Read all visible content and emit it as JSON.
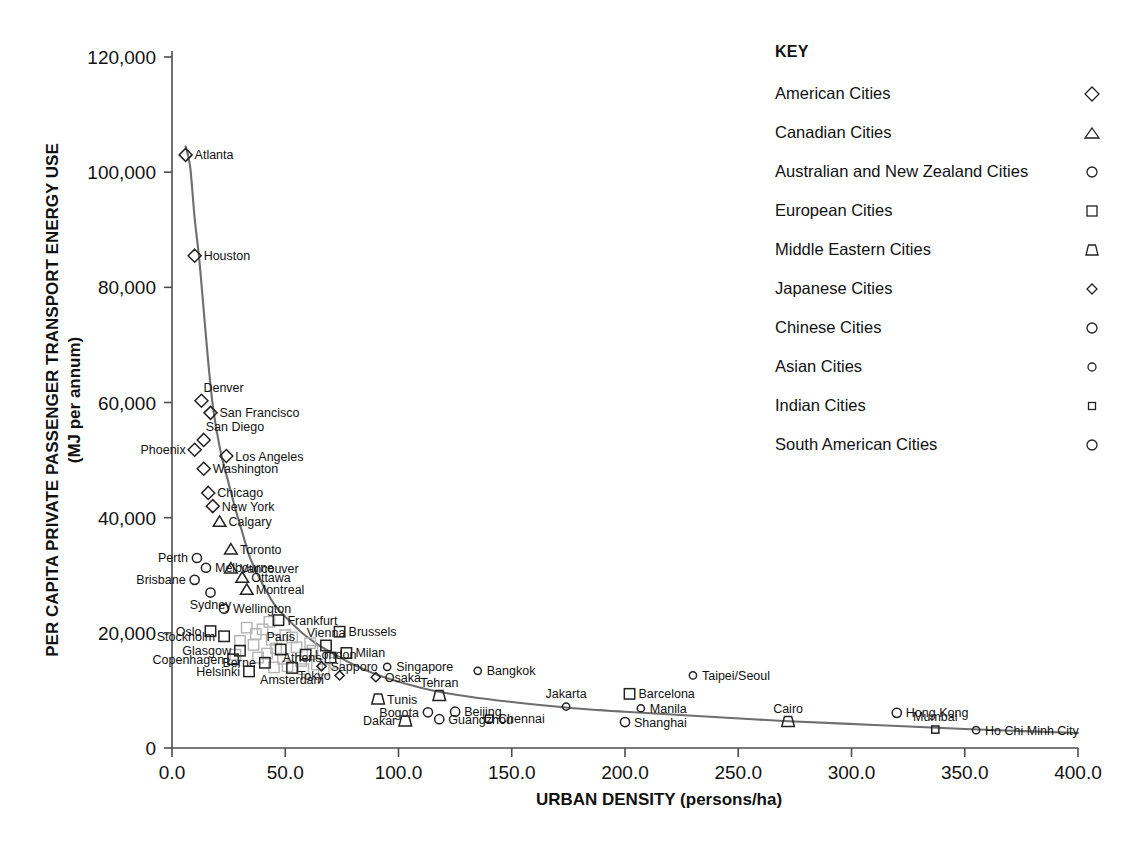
{
  "chart_data": {
    "type": "scatter",
    "title": "",
    "xlabel": "URBAN DENSITY (persons/ha)",
    "ylabel": "PER CAPITA PRIVATE PASSENGER TRANSPORT ENERGY USE",
    "ylabel_sub": "(MJ per annum)",
    "xlim": [
      0,
      400
    ],
    "ylim": [
      0,
      120000
    ],
    "xticks": [
      "0.0",
      "50.0",
      "100.0",
      "150.0",
      "200.0",
      "250.0",
      "300.0",
      "350.0",
      "400.0"
    ],
    "xtick_values": [
      0,
      50,
      100,
      150,
      200,
      250,
      300,
      350,
      400
    ],
    "yticks": [
      "0",
      "20,000",
      "40,000",
      "60,000",
      "80,000",
      "100,000",
      "120,000"
    ],
    "ytick_values": [
      0,
      20000,
      40000,
      60000,
      80000,
      100000,
      120000
    ],
    "grid": false,
    "legend_position": "right",
    "trend_curve": [
      [
        6,
        104500
      ],
      [
        8,
        101000
      ],
      [
        10,
        92000
      ],
      [
        12,
        85000
      ],
      [
        14,
        76000
      ],
      [
        16,
        67000
      ],
      [
        18,
        59500
      ],
      [
        20,
        54500
      ],
      [
        22,
        50500
      ],
      [
        25,
        46000
      ],
      [
        28,
        41500
      ],
      [
        31,
        37500
      ],
      [
        34,
        33500
      ],
      [
        38,
        30000
      ],
      [
        42,
        27000
      ],
      [
        46,
        24500
      ],
      [
        52,
        22000
      ],
      [
        58,
        19800
      ],
      [
        65,
        17800
      ],
      [
        72,
        16200
      ],
      [
        80,
        14500
      ],
      [
        90,
        12800
      ],
      [
        100,
        11500
      ],
      [
        115,
        10000
      ],
      [
        130,
        9000
      ],
      [
        150,
        8000
      ],
      [
        175,
        7000
      ],
      [
        200,
        6300
      ],
      [
        230,
        5600
      ],
      [
        270,
        4700
      ],
      [
        310,
        4000
      ],
      [
        350,
        3300
      ],
      [
        400,
        2600
      ]
    ],
    "points": [
      {
        "city": "Atlanta",
        "x": 6,
        "y": 103000,
        "group": "american",
        "label_pos": "right"
      },
      {
        "city": "Houston",
        "x": 10,
        "y": 85500,
        "group": "american",
        "label_pos": "right"
      },
      {
        "city": "Denver",
        "x": 13,
        "y": 60300,
        "group": "american",
        "label_pos": "above-right"
      },
      {
        "city": "San Francisco",
        "x": 17,
        "y": 58200,
        "group": "american",
        "label_pos": "right"
      },
      {
        "city": "San Diego",
        "x": 14,
        "y": 53500,
        "group": "american",
        "label_pos": "above-right"
      },
      {
        "city": "Phoenix",
        "x": 10,
        "y": 51800,
        "group": "american",
        "label_pos": "left"
      },
      {
        "city": "Los Angeles",
        "x": 24,
        "y": 50700,
        "group": "american",
        "label_pos": "right"
      },
      {
        "city": "Washington",
        "x": 14,
        "y": 48500,
        "group": "american",
        "label_pos": "right"
      },
      {
        "city": "Chicago",
        "x": 16,
        "y": 44300,
        "group": "american",
        "label_pos": "right"
      },
      {
        "city": "New York",
        "x": 18,
        "y": 42000,
        "group": "american",
        "label_pos": "right"
      },
      {
        "city": "Calgary",
        "x": 21,
        "y": 39300,
        "group": "canadian",
        "label_pos": "right"
      },
      {
        "city": "Toronto",
        "x": 26,
        "y": 34500,
        "group": "canadian",
        "label_pos": "right"
      },
      {
        "city": "Perth",
        "x": 11,
        "y": 33000,
        "group": "australian",
        "label_pos": "left"
      },
      {
        "city": "Melbourne",
        "x": 15,
        "y": 31300,
        "group": "australian",
        "label_pos": "right"
      },
      {
        "city": "Vancouver",
        "x": 26,
        "y": 31200,
        "group": "canadian",
        "label_pos": "right"
      },
      {
        "city": "Brisbane",
        "x": 10,
        "y": 29200,
        "group": "australian",
        "label_pos": "left"
      },
      {
        "city": "Ottawa",
        "x": 31,
        "y": 29600,
        "group": "canadian",
        "label_pos": "right"
      },
      {
        "city": "Montreal",
        "x": 33,
        "y": 27500,
        "group": "canadian",
        "label_pos": "right"
      },
      {
        "city": "Sydney",
        "x": 17,
        "y": 27000,
        "group": "australian",
        "label_pos": "below"
      },
      {
        "city": "Wellington",
        "x": 23,
        "y": 24200,
        "group": "australian",
        "label_pos": "right"
      },
      {
        "city": "Frankfurt",
        "x": 47,
        "y": 22200,
        "group": "european",
        "label_pos": "right"
      },
      {
        "city": "Oslo",
        "x": 17,
        "y": 20300,
        "group": "european",
        "label_pos": "left"
      },
      {
        "city": "Brussels",
        "x": 74,
        "y": 20200,
        "group": "european",
        "label_pos": "right"
      },
      {
        "city": "Stockholm",
        "x": 23,
        "y": 19400,
        "group": "european",
        "label_pos": "left"
      },
      {
        "city": "Vienna",
        "x": 68,
        "y": 17800,
        "group": "european",
        "label_pos": "above"
      },
      {
        "city": "Glasgow",
        "x": 30,
        "y": 16900,
        "group": "european",
        "label_pos": "left"
      },
      {
        "city": "Paris",
        "x": 48,
        "y": 17100,
        "group": "european",
        "label_pos": "above"
      },
      {
        "city": "London",
        "x": 59,
        "y": 16200,
        "group": "european",
        "label_pos": "right"
      },
      {
        "city": "Milan",
        "x": 77,
        "y": 16500,
        "group": "european",
        "label_pos": "right"
      },
      {
        "city": "Athens",
        "x": 70,
        "y": 15700,
        "group": "european",
        "label_pos": "left"
      },
      {
        "city": "Copenhagen",
        "x": 27,
        "y": 15400,
        "group": "european",
        "label_pos": "left"
      },
      {
        "city": "Berne",
        "x": 41,
        "y": 14800,
        "group": "european",
        "label_pos": "left"
      },
      {
        "city": "Amsterdam",
        "x": 53,
        "y": 13900,
        "group": "european",
        "label_pos": "below"
      },
      {
        "city": "Helsinki",
        "x": 34,
        "y": 13300,
        "group": "european",
        "label_pos": "left"
      },
      {
        "city": "Sapporo",
        "x": 66,
        "y": 14200,
        "group": "japanese",
        "label_pos": "right"
      },
      {
        "city": "Singapore",
        "x": 95,
        "y": 14100,
        "group": "asian",
        "label_pos": "right"
      },
      {
        "city": "Tokyo",
        "x": 74,
        "y": 12600,
        "group": "japanese",
        "label_pos": "left"
      },
      {
        "city": "Osaka",
        "x": 90,
        "y": 12300,
        "group": "japanese",
        "label_pos": "right"
      },
      {
        "city": "Bangkok",
        "x": 135,
        "y": 13400,
        "group": "asian",
        "label_pos": "right"
      },
      {
        "city": "Taipei/Seoul",
        "x": 230,
        "y": 12600,
        "group": "asian",
        "label_pos": "right"
      },
      {
        "city": "Tunis",
        "x": 91,
        "y": 8500,
        "group": "middle_eastern",
        "label_pos": "right"
      },
      {
        "city": "Tehran",
        "x": 118,
        "y": 9100,
        "group": "middle_eastern",
        "label_pos": "above"
      },
      {
        "city": "Barcelona",
        "x": 202,
        "y": 9400,
        "group": "european",
        "label_pos": "right"
      },
      {
        "city": "Jakarta",
        "x": 174,
        "y": 7200,
        "group": "asian",
        "label_pos": "above"
      },
      {
        "city": "Manila",
        "x": 207,
        "y": 6900,
        "group": "asian",
        "label_pos": "right"
      },
      {
        "city": "Bogota",
        "x": 113,
        "y": 6200,
        "group": "south_american",
        "label_pos": "left"
      },
      {
        "city": "Beijing",
        "x": 125,
        "y": 6300,
        "group": "chinese",
        "label_pos": "right"
      },
      {
        "city": "Guangzhou",
        "x": 118,
        "y": 5000,
        "group": "chinese",
        "label_pos": "right"
      },
      {
        "city": "Dakar",
        "x": 103,
        "y": 4700,
        "group": "middle_eastern",
        "label_pos": "left"
      },
      {
        "city": "Chennai",
        "x": 140,
        "y": 5100,
        "group": "indian",
        "label_pos": "right"
      },
      {
        "city": "Shanghai",
        "x": 200,
        "y": 4500,
        "group": "chinese",
        "label_pos": "right"
      },
      {
        "city": "Cairo",
        "x": 272,
        "y": 4600,
        "group": "middle_eastern",
        "label_pos": "above"
      },
      {
        "city": "Hong Kong",
        "x": 320,
        "y": 6100,
        "group": "chinese",
        "label_pos": "right"
      },
      {
        "city": "Mumbai",
        "x": 337,
        "y": 3200,
        "group": "indian",
        "label_pos": "above"
      },
      {
        "city": "Ho Chi Minh City",
        "x": 355,
        "y": 3100,
        "group": "asian",
        "label_pos": "right"
      }
    ],
    "unlabeled_points": [
      {
        "x": 33,
        "y": 20900,
        "group": "european"
      },
      {
        "x": 37,
        "y": 19800,
        "group": "european"
      },
      {
        "x": 40,
        "y": 20600,
        "group": "european"
      },
      {
        "x": 43,
        "y": 21900,
        "group": "european"
      },
      {
        "x": 44,
        "y": 18800,
        "group": "european"
      },
      {
        "x": 50,
        "y": 19600,
        "group": "european"
      },
      {
        "x": 53,
        "y": 19200,
        "group": "european"
      },
      {
        "x": 55,
        "y": 17500,
        "group": "european"
      },
      {
        "x": 46,
        "y": 17300,
        "group": "european"
      },
      {
        "x": 42,
        "y": 16400,
        "group": "european"
      },
      {
        "x": 38,
        "y": 15700,
        "group": "european"
      },
      {
        "x": 36,
        "y": 17900,
        "group": "european"
      },
      {
        "x": 49,
        "y": 15500,
        "group": "european"
      },
      {
        "x": 57,
        "y": 15100,
        "group": "european"
      },
      {
        "x": 62,
        "y": 16900,
        "group": "european"
      },
      {
        "x": 64,
        "y": 14500,
        "group": "european"
      },
      {
        "x": 58,
        "y": 13700,
        "group": "european"
      },
      {
        "x": 51,
        "y": 14200,
        "group": "european"
      },
      {
        "x": 45,
        "y": 14000,
        "group": "european"
      },
      {
        "x": 30,
        "y": 18600,
        "group": "european"
      },
      {
        "x": 28,
        "y": 16200,
        "group": "european"
      },
      {
        "x": 67,
        "y": 13600,
        "group": "european"
      },
      {
        "x": 72,
        "y": 14800,
        "group": "european"
      },
      {
        "x": 61,
        "y": 18200,
        "group": "european"
      }
    ],
    "legend": {
      "title": "KEY",
      "entries": [
        {
          "label": "American Cities",
          "marker": "diamond",
          "key": "american"
        },
        {
          "label": "Canadian Cities",
          "marker": "triangle",
          "key": "canadian"
        },
        {
          "label": "Australian and New Zealand Cities",
          "marker": "circle",
          "key": "australian"
        },
        {
          "label": "European Cities",
          "marker": "square",
          "key": "european"
        },
        {
          "label": "Middle Eastern Cities",
          "marker": "trapezoid",
          "key": "middle_eastern"
        },
        {
          "label": "Japanese Cities",
          "marker": "small-diamond",
          "key": "japanese"
        },
        {
          "label": "Chinese Cities",
          "marker": "circle",
          "key": "chinese"
        },
        {
          "label": "Asian Cities",
          "marker": "small-circle",
          "key": "asian"
        },
        {
          "label": "Indian Cities",
          "marker": "small-square",
          "key": "indian"
        },
        {
          "label": "South American Cities",
          "marker": "circle",
          "key": "south_american"
        }
      ]
    },
    "colors": {
      "axis": "#4d4d4d",
      "marker": "#222222",
      "marker_faded": "#b4b4b4",
      "trend": "#6e6e6e",
      "text": "#111111",
      "background": "#ffffff"
    }
  }
}
